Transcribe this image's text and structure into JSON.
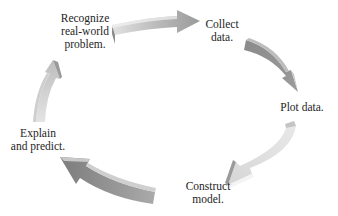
{
  "diagram": {
    "type": "cycle",
    "steps": [
      {
        "id": "recognize",
        "lines": [
          "Recognize",
          "real-world",
          "problem."
        ]
      },
      {
        "id": "collect",
        "lines": [
          "Collect",
          "data."
        ]
      },
      {
        "id": "plot",
        "lines": [
          "Plot data."
        ]
      },
      {
        "id": "construct",
        "lines": [
          "Construct",
          "model."
        ]
      },
      {
        "id": "explain",
        "lines": [
          "Explain",
          "and predict."
        ]
      }
    ],
    "arrows": [
      {
        "from": "recognize",
        "to": "collect",
        "direction": "clockwise"
      },
      {
        "from": "collect",
        "to": "plot",
        "direction": "clockwise"
      },
      {
        "from": "plot",
        "to": "construct",
        "direction": "clockwise"
      },
      {
        "from": "construct",
        "to": "explain",
        "direction": "clockwise"
      },
      {
        "from": "explain",
        "to": "recognize",
        "direction": "clockwise"
      }
    ],
    "colors": {
      "arrow_light": "#d9d9d9",
      "arrow_mid": "#a8a8a8",
      "arrow_dark": "#808080",
      "text": "#1e1e1e",
      "background": "#ffffff"
    }
  }
}
